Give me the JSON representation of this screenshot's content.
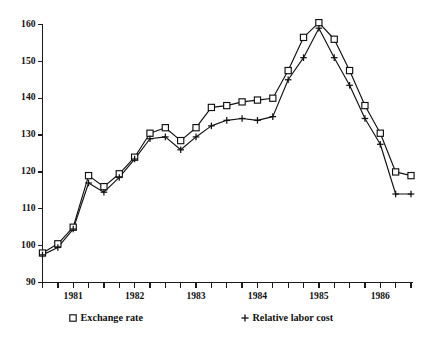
{
  "chart_data": {
    "type": "line",
    "title": "",
    "subtitle": "",
    "xlabel": "",
    "ylabel": "",
    "ylim": [
      90,
      160
    ],
    "yticks": [
      90,
      100,
      110,
      120,
      130,
      140,
      150,
      160
    ],
    "ytick_labels": [
      "90",
      "100",
      "110",
      "120",
      "130",
      "140",
      "150",
      "160"
    ],
    "xlim": [
      "1980Q4",
      "1986Q4"
    ],
    "x": [
      "1980Q4",
      "1981Q1",
      "1981Q2",
      "1981Q3",
      "1981Q4",
      "1982Q1",
      "1982Q2",
      "1982Q3",
      "1982Q4",
      "1983Q1",
      "1983Q2",
      "1983Q3",
      "1983Q4",
      "1984Q1",
      "1984Q2",
      "1984Q3",
      "1984Q4",
      "1985Q1",
      "1985Q2",
      "1985Q3",
      "1985Q4",
      "1986Q1",
      "1986Q2",
      "1986Q3",
      "1986Q4"
    ],
    "xtick_labels": [
      "1981",
      "1982",
      "1983",
      "1984",
      "1985",
      "1986"
    ],
    "xtick_positions": [
      "1981Q2",
      "1982Q2",
      "1983Q2",
      "1984Q2",
      "1985Q2",
      "1986Q2"
    ],
    "grid": false,
    "legend_position": "below-axes",
    "series": [
      {
        "name": "Exchange rate",
        "marker": "square",
        "values": [
          98.0,
          100.5,
          105.0,
          119.0,
          116.0,
          119.5,
          124.0,
          130.5,
          132.0,
          128.5,
          132.0,
          137.5,
          138.0,
          139.0,
          139.5,
          140.0,
          147.5,
          156.5,
          160.5,
          156.0,
          147.5,
          138.0,
          130.5,
          120.0,
          119.0
        ]
      },
      {
        "name": "Relative labor cost",
        "marker": "plus",
        "values": [
          97.5,
          99.5,
          104.5,
          117.0,
          114.5,
          118.5,
          123.5,
          129.0,
          129.5,
          126.0,
          129.5,
          132.5,
          134.0,
          134.5,
          134.0,
          135.0,
          145.0,
          151.0,
          159.0,
          151.0,
          143.5,
          134.5,
          127.5,
          114.0,
          114.0
        ]
      }
    ]
  },
  "legend": {
    "items": [
      {
        "symbol": "square",
        "label": "Exchange rate"
      },
      {
        "symbol": "plus",
        "label": "Relative labor cost"
      }
    ]
  }
}
